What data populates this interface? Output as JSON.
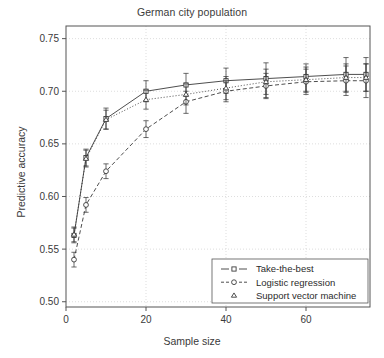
{
  "chart_data": {
    "type": "line",
    "title": "German city population",
    "xlabel": "Sample size",
    "ylabel": "Predictive accuracy",
    "xlim": [
      0,
      76
    ],
    "ylim": [
      0.495,
      0.762
    ],
    "xticks": [
      0,
      20,
      40,
      60
    ],
    "xticklabels": [
      "0",
      "20",
      "40",
      "60"
    ],
    "yticks": [
      0.5,
      0.55,
      0.6,
      0.65,
      0.7,
      0.75
    ],
    "yticklabels": [
      "0.50",
      "0.55",
      "0.60",
      "0.65",
      "0.70",
      "0.75"
    ],
    "grid": true,
    "grid_style": "dotted",
    "legend_position": "bottom-right",
    "x": [
      2,
      5,
      10,
      20,
      30,
      40,
      50,
      60,
      70,
      75
    ],
    "series": [
      {
        "name": "Take-the-best",
        "marker": "square",
        "linestyle": "solid",
        "values": [
          0.563,
          0.637,
          0.674,
          0.7,
          0.706,
          0.71,
          0.712,
          0.714,
          0.716,
          0.716
        ],
        "err_low": [
          0.556,
          0.629,
          0.664,
          0.69,
          0.695,
          0.698,
          0.694,
          0.7,
          0.699,
          0.7
        ],
        "err_high": [
          0.57,
          0.645,
          0.684,
          0.71,
          0.717,
          0.722,
          0.727,
          0.726,
          0.732,
          0.732
        ]
      },
      {
        "name": "Logistic regression",
        "marker": "circle",
        "linestyle": "dashed",
        "values": [
          0.54,
          0.592,
          0.624,
          0.664,
          0.69,
          0.7,
          0.705,
          0.709,
          0.71,
          0.71
        ],
        "err_low": [
          0.533,
          0.585,
          0.617,
          0.656,
          0.679,
          0.69,
          0.693,
          0.697,
          0.696,
          0.694
        ],
        "err_high": [
          0.547,
          0.599,
          0.631,
          0.672,
          0.7,
          0.71,
          0.717,
          0.721,
          0.724,
          0.726
        ]
      },
      {
        "name": "Support vector machine",
        "marker": "triangle",
        "linestyle": "dotted",
        "values": [
          0.564,
          0.636,
          0.673,
          0.692,
          0.697,
          0.703,
          0.709,
          0.711,
          0.713,
          0.713
        ],
        "err_low": [
          0.557,
          0.628,
          0.664,
          0.683,
          0.687,
          0.692,
          0.697,
          0.699,
          0.7,
          0.7
        ],
        "err_high": [
          0.571,
          0.644,
          0.682,
          0.701,
          0.707,
          0.714,
          0.721,
          0.723,
          0.726,
          0.726
        ]
      }
    ]
  },
  "legend": {
    "items": [
      {
        "label": "Take-the-best"
      },
      {
        "label": "Logistic regression"
      },
      {
        "label": "Support vector machine"
      }
    ]
  },
  "colors": {
    "line": "#3a3a3a",
    "grid": "#cfcfcf",
    "frame": "#555555",
    "background": "#ffffff"
  }
}
